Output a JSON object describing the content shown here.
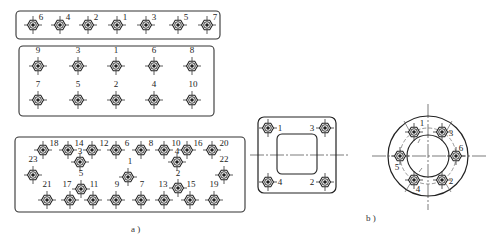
{
  "figure": {
    "caption_a": "a )",
    "caption_b": "b )"
  },
  "panel_a_row": {
    "description": "Single row of 7 bolts, tightening from center outward",
    "bolts": [
      {
        "label": "6",
        "x": 33,
        "y": 25
      },
      {
        "label": "4",
        "x": 60,
        "y": 25
      },
      {
        "label": "2",
        "x": 88,
        "y": 25
      },
      {
        "label": "1",
        "x": 117,
        "y": 25
      },
      {
        "label": "3",
        "x": 146,
        "y": 25
      },
      {
        "label": "5",
        "x": 178,
        "y": 25
      },
      {
        "label": "7",
        "x": 207,
        "y": 25
      }
    ]
  },
  "panel_a_double": {
    "description": "Two rows of 5 bolts",
    "bolts": [
      {
        "label": "9",
        "x": 38,
        "y": 66,
        "lx": 38,
        "ly": 53
      },
      {
        "label": "3",
        "x": 78,
        "y": 66,
        "lx": 78,
        "ly": 53
      },
      {
        "label": "1",
        "x": 116,
        "y": 66,
        "lx": 116,
        "ly": 53
      },
      {
        "label": "6",
        "x": 154,
        "y": 66,
        "lx": 154,
        "ly": 53
      },
      {
        "label": "8",
        "x": 192,
        "y": 66,
        "lx": 192,
        "ly": 53
      },
      {
        "label": "7",
        "x": 38,
        "y": 100,
        "lx": 38,
        "ly": 87
      },
      {
        "label": "5",
        "x": 78,
        "y": 100,
        "lx": 78,
        "ly": 87
      },
      {
        "label": "2",
        "x": 116,
        "y": 100,
        "lx": 116,
        "ly": 87
      },
      {
        "label": "4",
        "x": 154,
        "y": 100,
        "lx": 154,
        "ly": 87
      },
      {
        "label": "10",
        "x": 192,
        "y": 100,
        "lx": 193,
        "ly": 87
      }
    ]
  },
  "panel_a_large": {
    "description": "23-bolt rectangular pattern",
    "bolts": [
      {
        "label": "18",
        "x": 43,
        "y": 150,
        "lx": 54,
        "ly": 146
      },
      {
        "label": "14",
        "x": 68,
        "y": 150,
        "lx": 79,
        "ly": 146
      },
      {
        "label": "12",
        "x": 92,
        "y": 150,
        "lx": 104,
        "ly": 146
      },
      {
        "label": "6",
        "x": 116,
        "y": 150,
        "lx": 127,
        "ly": 146
      },
      {
        "label": "8",
        "x": 141,
        "y": 150,
        "lx": 151,
        "ly": 146
      },
      {
        "label": "10",
        "x": 164,
        "y": 150,
        "lx": 176,
        "ly": 146
      },
      {
        "label": "16",
        "x": 187,
        "y": 150,
        "lx": 198,
        "ly": 146
      },
      {
        "label": "20",
        "x": 212,
        "y": 150,
        "lx": 224,
        "ly": 146
      },
      {
        "label": "3",
        "x": 80,
        "y": 162,
        "lx": 80,
        "ly": 154
      },
      {
        "label": "4",
        "x": 177,
        "y": 162,
        "lx": 177,
        "ly": 154
      },
      {
        "label": "23",
        "x": 33,
        "y": 175,
        "lx": 33,
        "ly": 162
      },
      {
        "label": "1",
        "x": 128,
        "y": 177,
        "lx": 130,
        "ly": 164
      },
      {
        "label": "22",
        "x": 224,
        "y": 175,
        "lx": 224,
        "ly": 162
      },
      {
        "label": "5",
        "x": 81,
        "y": 189,
        "lx": 81,
        "ly": 176
      },
      {
        "label": "2",
        "x": 178,
        "y": 188,
        "lx": 178,
        "ly": 176
      },
      {
        "label": "21",
        "x": 47,
        "y": 200,
        "lx": 47,
        "ly": 187
      },
      {
        "label": "17",
        "x": 70,
        "y": 200,
        "lx": 67,
        "ly": 187
      },
      {
        "label": "11",
        "x": 93,
        "y": 200,
        "lx": 94,
        "ly": 187
      },
      {
        "label": "9",
        "x": 116,
        "y": 200,
        "lx": 117,
        "ly": 187
      },
      {
        "label": "7",
        "x": 141,
        "y": 200,
        "lx": 142,
        "ly": 187
      },
      {
        "label": "13",
        "x": 164,
        "y": 200,
        "lx": 163,
        "ly": 187
      },
      {
        "label": "15",
        "x": 190,
        "y": 200,
        "lx": 191,
        "ly": 187
      },
      {
        "label": "19",
        "x": 214,
        "y": 200,
        "lx": 214,
        "ly": 187
      }
    ]
  },
  "panel_b_square": {
    "description": "Square flange, 4 bolts cross pattern",
    "bolts": [
      {
        "label": "1",
        "x": 268,
        "y": 128,
        "lx": 280,
        "ly": 131
      },
      {
        "label": "3",
        "x": 325,
        "y": 128,
        "lx": 312,
        "ly": 131
      },
      {
        "label": "4",
        "x": 268,
        "y": 182,
        "lx": 280,
        "ly": 185
      },
      {
        "label": "2",
        "x": 325,
        "y": 182,
        "lx": 312,
        "ly": 185
      }
    ]
  },
  "panel_b_circular": {
    "description": "Circular flange, 6 bolts star pattern",
    "bolts": [
      {
        "label": "1",
        "x": 414,
        "y": 132,
        "lx": 422,
        "ly": 126
      },
      {
        "label": "3",
        "x": 442,
        "y": 132,
        "lx": 451,
        "ly": 136
      },
      {
        "label": "6",
        "x": 456,
        "y": 156,
        "lx": 461,
        "ly": 151
      },
      {
        "label": "2",
        "x": 442,
        "y": 180,
        "lx": 451,
        "ly": 184
      },
      {
        "label": "4",
        "x": 414,
        "y": 180,
        "lx": 418,
        "ly": 192
      },
      {
        "label": "5",
        "x": 400,
        "y": 156,
        "lx": 397,
        "ly": 170
      }
    ]
  }
}
